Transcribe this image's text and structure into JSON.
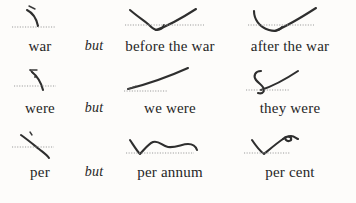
{
  "page": {
    "background_color": "#fdfcfa",
    "ink_color": "#3a3a3a",
    "baseline_color": "#9a9a9a"
  },
  "rows": [
    {
      "base": {
        "label": "war",
        "outline_name": "war-outline",
        "outline_description": "short curved stroke arcing down to the right with a small tick at the top, sitting above a dotted baseline"
      },
      "conjunction": "but",
      "phrases": [
        {
          "label": "before the war",
          "outline_name": "before-the-war-outline",
          "outline_description": "downward stroke from upper left meeting a small hook on the baseline, then a long upward stroke to the right"
        },
        {
          "label": "after the war",
          "outline_name": "after-the-war-outline",
          "outline_description": "shallow curve dipping below the baseline then a long upward stroke rising to the right"
        }
      ]
    },
    {
      "base": {
        "label": "were",
        "outline_name": "were-outline",
        "outline_description": "curved stroke descending to the right with a small mark at the top, crossing a dotted baseline"
      },
      "conjunction": "but",
      "phrases": [
        {
          "label": "we were",
          "outline_name": "we-were-outline",
          "outline_description": "long straight upward stroke rising left to right from a dotted baseline"
        },
        {
          "label": "they were",
          "outline_name": "they-were-outline",
          "outline_description": "small S-shaped hook on the baseline followed by a long upward stroke to the right"
        }
      ]
    },
    {
      "base": {
        "label": "per",
        "outline_name": "per-outline",
        "outline_description": "long curved stroke descending from upper left through the dotted baseline to lower right"
      },
      "conjunction": "but",
      "phrases": [
        {
          "label": "per annum",
          "outline_name": "per-annum-outline",
          "outline_description": "sharp V on the baseline followed by a wavy horizontal stroke running to the right"
        },
        {
          "label": "per cent",
          "outline_name": "per-cent-outline",
          "outline_description": "sharp V on the baseline with a small loop at the upper right end"
        }
      ]
    }
  ]
}
